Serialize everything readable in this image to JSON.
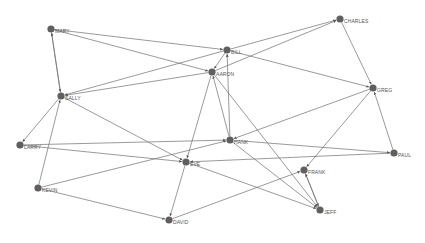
{
  "diagram": {
    "type": "directed-network",
    "colors": {
      "node": "#5f5f5f",
      "edge": "#6e6e6e",
      "label": "#555555",
      "background": "#ffffff"
    },
    "nodes": [
      {
        "id": "MARY",
        "label": "MARY",
        "x": 51,
        "y": 29
      },
      {
        "id": "CHARLES",
        "label": "CHARLES",
        "x": 340,
        "y": 19
      },
      {
        "id": "BILL",
        "label": "BILL",
        "x": 227,
        "y": 50
      },
      {
        "id": "AARON",
        "label": "AARON",
        "x": 212,
        "y": 72
      },
      {
        "id": "SALLY",
        "label": "SALLY",
        "x": 61,
        "y": 96
      },
      {
        "id": "GREG",
        "label": "GREG",
        "x": 373,
        "y": 88
      },
      {
        "id": "LARRY",
        "label": "LARRY",
        "x": 20,
        "y": 145
      },
      {
        "id": "HANK",
        "label": "HANK",
        "x": 230,
        "y": 140
      },
      {
        "id": "PAUL",
        "label": "PAUL",
        "x": 394,
        "y": 153
      },
      {
        "id": "EVE",
        "label": "EVE",
        "x": 186,
        "y": 162
      },
      {
        "id": "FRANK",
        "label": "FRANK",
        "x": 304,
        "y": 170
      },
      {
        "id": "KEVIN",
        "label": "KEVIN",
        "x": 38,
        "y": 188
      },
      {
        "id": "JEFF",
        "label": "JEFF",
        "x": 320,
        "y": 210
      },
      {
        "id": "DAVID",
        "label": "DAVID",
        "x": 169,
        "y": 220
      }
    ],
    "edges": [
      {
        "from": "MARY",
        "to": "BILL"
      },
      {
        "from": "MARY",
        "to": "AARON"
      },
      {
        "from": "MARY",
        "to": "SALLY"
      },
      {
        "from": "SALLY",
        "to": "MARY"
      },
      {
        "from": "BILL",
        "to": "CHARLES"
      },
      {
        "from": "AARON",
        "to": "CHARLES"
      },
      {
        "from": "CHARLES",
        "to": "GREG"
      },
      {
        "from": "BILL",
        "to": "GREG"
      },
      {
        "from": "BILL",
        "to": "AARON"
      },
      {
        "from": "BILL",
        "to": "SALLY"
      },
      {
        "from": "HANK",
        "to": "BILL"
      },
      {
        "from": "AARON",
        "to": "SALLY"
      },
      {
        "from": "AARON",
        "to": "EVE"
      },
      {
        "from": "HANK",
        "to": "AARON"
      },
      {
        "from": "AARON",
        "to": "JEFF"
      },
      {
        "from": "SALLY",
        "to": "LARRY"
      },
      {
        "from": "SALLY",
        "to": "EVE"
      },
      {
        "from": "KEVIN",
        "to": "SALLY"
      },
      {
        "from": "KEVIN",
        "to": "HANK"
      },
      {
        "from": "KEVIN",
        "to": "DAVID"
      },
      {
        "from": "LARRY",
        "to": "HANK"
      },
      {
        "from": "LARRY",
        "to": "EVE"
      },
      {
        "from": "GREG",
        "to": "HANK"
      },
      {
        "from": "GREG",
        "to": "FRANK"
      },
      {
        "from": "PAUL",
        "to": "GREG"
      },
      {
        "from": "PAUL",
        "to": "EVE"
      },
      {
        "from": "HANK",
        "to": "PAUL"
      },
      {
        "from": "HANK",
        "to": "JEFF"
      },
      {
        "from": "EVE",
        "to": "JEFF"
      },
      {
        "from": "EVE",
        "to": "DAVID"
      },
      {
        "from": "DAVID",
        "to": "FRANK"
      },
      {
        "from": "FRANK",
        "to": "JEFF"
      },
      {
        "from": "JEFF",
        "to": "FRANK"
      }
    ]
  }
}
